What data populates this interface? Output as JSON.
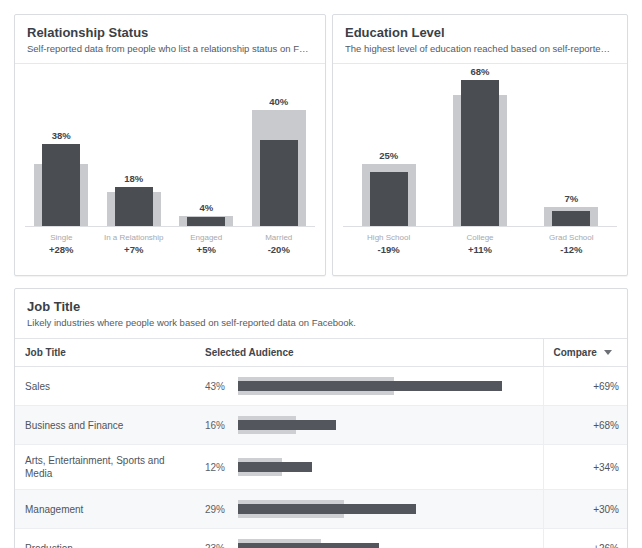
{
  "watermark": "",
  "panels": [
    {
      "id": "relationship-status",
      "title": "Relationship Status",
      "subtitle": "Self-reported data from people who list a relationship status on F…"
    },
    {
      "id": "education-level",
      "title": "Education Level",
      "subtitle": "The highest level of education reached based on self-reported da…"
    }
  ],
  "job": {
    "title": "Job Title",
    "subtitle": "Likely industries where people work based on self-reported data on Facebook.",
    "columns": [
      "Job Title",
      "Selected Audience",
      "Compare"
    ],
    "rows": [
      {
        "title": "Sales",
        "audience": "43%",
        "compare": "+69%"
      },
      {
        "title": "Business and Finance",
        "audience": "16%",
        "compare": "+68%"
      },
      {
        "title": "Arts, Entertainment, Sports and Media",
        "audience": "12%",
        "compare": "+34%"
      },
      {
        "title": "Management",
        "audience": "29%",
        "compare": "+30%"
      },
      {
        "title": "Production",
        "audience": "23%",
        "compare": "+26%"
      }
    ]
  },
  "colors": {
    "selected_bar": "#4a4d52",
    "compare_bar": "#c8cacd",
    "panel_border": "#d9dce1",
    "text_primary": "#3b3f46",
    "text_secondary": "#555a61"
  },
  "chart_data": [
    {
      "type": "bar",
      "title": "Relationship Status",
      "subtitle": "Self-reported data from people who list a relationship status on F…",
      "xlabel": "",
      "ylabel": "",
      "ylim": [
        0,
        72
      ],
      "grid": false,
      "legend": "none",
      "categories": [
        "Single",
        "In a Relationship",
        "Engaged",
        "Married"
      ],
      "value_labels": [
        "38%",
        "18%",
        "4%",
        "40%"
      ],
      "delta_labels": [
        "+28%",
        "+7%",
        "+5%",
        "-20%"
      ],
      "series": [
        {
          "name": "Selected Audience",
          "values": [
            38,
            18,
            4,
            40
          ]
        },
        {
          "name": "Compare",
          "values": [
            29,
            16,
            4.5,
            54
          ]
        }
      ]
    },
    {
      "type": "bar",
      "title": "Education Level",
      "subtitle": "The highest level of education reached based on self-reported da…",
      "xlabel": "",
      "ylabel": "",
      "ylim": [
        0,
        72
      ],
      "grid": false,
      "legend": "none",
      "categories": [
        "High School",
        "College",
        "Grad School"
      ],
      "value_labels": [
        "25%",
        "68%",
        "7%"
      ],
      "delta_labels": [
        "-19%",
        "+11%",
        "-12%"
      ],
      "series": [
        {
          "name": "Selected Audience",
          "values": [
            25,
            68,
            7
          ]
        },
        {
          "name": "Compare",
          "values": [
            29,
            61,
            9
          ]
        }
      ]
    },
    {
      "type": "bar",
      "title": "Job Title",
      "subtitle": "Likely industries where people work based on self-reported data on Facebook.",
      "orientation": "horizontal",
      "categories": [
        "Sales",
        "Business and Finance",
        "Arts, Entertainment, Sports and Media",
        "Management",
        "Production"
      ],
      "value_labels": [
        "43%",
        "16%",
        "12%",
        "29%",
        "23%"
      ],
      "compare_labels": [
        "+69%",
        "+68%",
        "+34%",
        "+30%",
        "+26%"
      ],
      "series": [
        {
          "name": "Selected Audience",
          "values": [
            43,
            16,
            12,
            29,
            23
          ]
        },
        {
          "name": "Compare",
          "values": [
            25.4,
            9.5,
            7.1,
            17.2,
            13.6
          ]
        }
      ],
      "xlim": [
        0,
        48
      ]
    }
  ]
}
